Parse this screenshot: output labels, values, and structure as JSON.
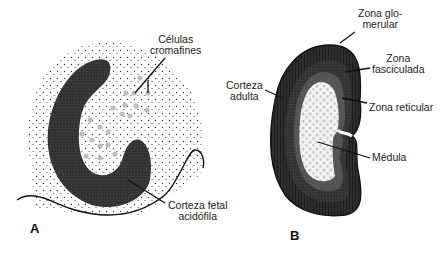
{
  "figure": {
    "panels": [
      {
        "id": "A",
        "label": "A",
        "structures": [
          "Células cromafines",
          "Corteza fetal acidófila"
        ],
        "annotations": {
          "celulas_cromafines": [
            "Células",
            "cromafines"
          ],
          "corteza_fetal": [
            "Corteza fetal",
            "acidófila"
          ]
        }
      },
      {
        "id": "B",
        "label": "B",
        "structures": [
          "Zona glomerular",
          "Zona fasciculada",
          "Corteza adulta",
          "Zona reticular",
          "Médula"
        ],
        "annotations": {
          "zona_glomerular": [
            "Zona glo-",
            "merular"
          ],
          "zona_fasciculada": [
            "Zona",
            "fasciculada"
          ],
          "corteza_adulta": [
            "Corteza",
            "adulta"
          ],
          "zona_reticular": [
            "Zona reticular"
          ],
          "medula": [
            "Médula"
          ]
        }
      }
    ],
    "colors": {
      "cortex_dark": "#2b2b2b",
      "cortex_mid": "#4a4a4a",
      "medulla_dots": "#bdbdbd",
      "stipple": "#333333",
      "background": "#ffffff"
    }
  }
}
